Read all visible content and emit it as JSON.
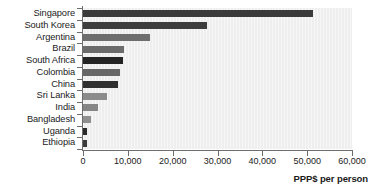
{
  "chart_data": {
    "type": "bar",
    "orientation": "horizontal",
    "title": "",
    "subtitle": "",
    "xlabel": "PPP$ per person",
    "ylabel": "",
    "xlim": [
      0,
      60000
    ],
    "ylim": null,
    "grid": false,
    "legend": null,
    "xticks": [
      0,
      10000,
      20000,
      30000,
      40000,
      50000,
      60000
    ],
    "xtick_labels": [
      "0",
      "10,000",
      "20,000",
      "30,000",
      "40,000",
      "50,000",
      "60,000"
    ],
    "categories": [
      "Singapore",
      "South Korea",
      "Argentina",
      "Brazil",
      "South Africa",
      "Colombia",
      "China",
      "Sri Lanka",
      "India",
      "Bangladesh",
      "Uganda",
      "Ethiopia"
    ],
    "values": [
      51300,
      27700,
      14900,
      9200,
      9000,
      8300,
      7700,
      5350,
      3350,
      1800,
      900,
      850
    ],
    "bar_colors": [
      "#3a3a3a",
      "#3d3d3d",
      "#6e6e6e",
      "#6b6b6b",
      "#242424",
      "#676767",
      "#303030",
      "#8b8b8b",
      "#868686",
      "#8f8f8f",
      "#2a2a2a",
      "#3b3b3b"
    ],
    "plot_background": "#eeeeee",
    "axis_color": "#6d6d6d",
    "text_color": "#1b1b1b"
  }
}
